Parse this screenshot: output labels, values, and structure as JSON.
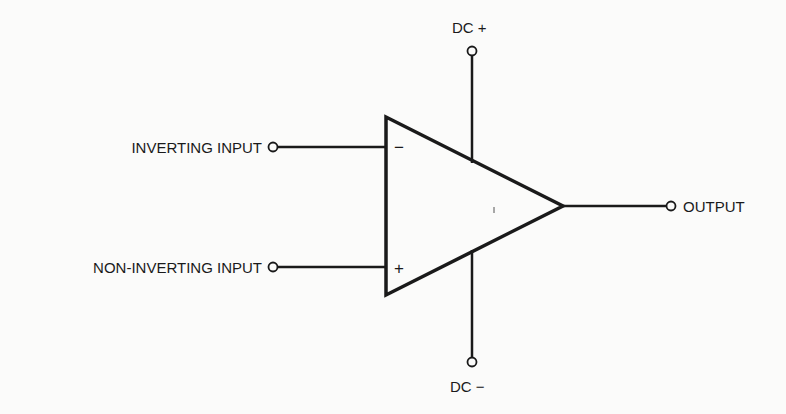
{
  "diagram": {
    "terminals": {
      "dc_plus": "DC +",
      "dc_minus": "DC −",
      "inverting_input": "INVERTING INPUT",
      "non_inverting_input": "NON-INVERTING INPUT",
      "output": "OUTPUT"
    },
    "pin_marks": {
      "inverting": "−",
      "non_inverting": "+"
    },
    "colors": {
      "stroke": "#1a1a1a",
      "background": "#fbfbfa"
    }
  }
}
